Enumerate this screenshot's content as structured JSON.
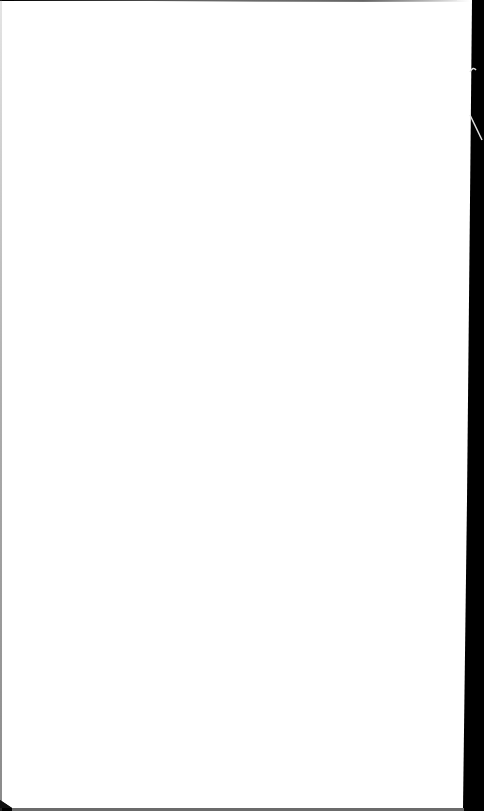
{
  "scene": {
    "description": "Photo of a blank white sheet of paper against a dark background",
    "paper_color": "#ffffff",
    "background_color": "#000000",
    "visible_text": []
  }
}
